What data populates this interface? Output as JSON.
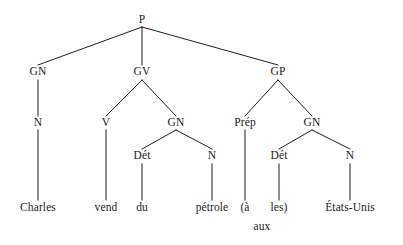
{
  "figure": {
    "kind": "syntax-tree",
    "language": "French",
    "sentence": "Charles vend du pétrole aux États-Unis",
    "line_color": "#1f1f1f",
    "text_color": "#1a1a1a",
    "background_color": "#ffffff"
  },
  "nodes": [
    {
      "id": "P",
      "label": "P",
      "x": 142,
      "y": 20,
      "type": "category"
    },
    {
      "id": "GN1",
      "label": "GN",
      "x": 38,
      "y": 72,
      "type": "category"
    },
    {
      "id": "GV",
      "label": "GV",
      "x": 142,
      "y": 72,
      "type": "category"
    },
    {
      "id": "GP",
      "label": "GP",
      "x": 278,
      "y": 72,
      "type": "category"
    },
    {
      "id": "N1",
      "label": "N",
      "x": 38,
      "y": 123,
      "type": "category"
    },
    {
      "id": "V",
      "label": "V",
      "x": 106,
      "y": 123,
      "type": "category"
    },
    {
      "id": "GN2",
      "label": "GN",
      "x": 176,
      "y": 123,
      "type": "category"
    },
    {
      "id": "Prep",
      "label": "Prép",
      "x": 245,
      "y": 123,
      "type": "category"
    },
    {
      "id": "GN3",
      "label": "GN",
      "x": 312,
      "y": 123,
      "type": "category"
    },
    {
      "id": "Det1",
      "label": "Dét",
      "x": 142,
      "y": 156,
      "type": "category"
    },
    {
      "id": "N2",
      "label": "N",
      "x": 212,
      "y": 156,
      "type": "category"
    },
    {
      "id": "Det2",
      "label": "Dét",
      "x": 279,
      "y": 156,
      "type": "category"
    },
    {
      "id": "N3",
      "label": "N",
      "x": 350,
      "y": 156,
      "type": "category"
    },
    {
      "id": "w_charles",
      "label": "Charles",
      "x": 38,
      "y": 208,
      "type": "leaf"
    },
    {
      "id": "w_vend",
      "label": "vend",
      "x": 106,
      "y": 208,
      "type": "leaf"
    },
    {
      "id": "w_du",
      "label": "du",
      "x": 142,
      "y": 208,
      "type": "leaf"
    },
    {
      "id": "w_petrole",
      "label": "pétrole",
      "x": 212,
      "y": 208,
      "type": "leaf"
    },
    {
      "id": "w_a",
      "label": "(à",
      "x": 245,
      "y": 208,
      "type": "leaf"
    },
    {
      "id": "w_les",
      "label": "les)",
      "x": 279,
      "y": 208,
      "type": "leaf"
    },
    {
      "id": "w_etats",
      "label": "États-Unis",
      "x": 350,
      "y": 208,
      "type": "leaf"
    },
    {
      "id": "w_aux",
      "label": "aux",
      "x": 262,
      "y": 227,
      "type": "gloss"
    }
  ],
  "edges": [
    {
      "from": "P",
      "to": "GN1",
      "x1": 142,
      "y1": 27,
      "x2": 38,
      "y2": 65
    },
    {
      "from": "P",
      "to": "GV",
      "x1": 142,
      "y1": 27,
      "x2": 142,
      "y2": 65
    },
    {
      "from": "P",
      "to": "GP",
      "x1": 142,
      "y1": 27,
      "x2": 278,
      "y2": 65
    },
    {
      "from": "GN1",
      "to": "N1",
      "x1": 38,
      "y1": 80,
      "x2": 38,
      "y2": 116
    },
    {
      "from": "GV",
      "to": "V",
      "x1": 142,
      "y1": 80,
      "x2": 106,
      "y2": 116
    },
    {
      "from": "GV",
      "to": "GN2",
      "x1": 142,
      "y1": 80,
      "x2": 176,
      "y2": 116
    },
    {
      "from": "GP",
      "to": "Prep",
      "x1": 278,
      "y1": 80,
      "x2": 245,
      "y2": 116
    },
    {
      "from": "GP",
      "to": "GN3",
      "x1": 278,
      "y1": 80,
      "x2": 312,
      "y2": 116
    },
    {
      "from": "N1",
      "to": "w_charles",
      "x1": 38,
      "y1": 130,
      "x2": 38,
      "y2": 200
    },
    {
      "from": "V",
      "to": "w_vend",
      "x1": 106,
      "y1": 130,
      "x2": 106,
      "y2": 200
    },
    {
      "from": "GN2",
      "to": "Det1",
      "x1": 176,
      "y1": 130,
      "x2": 142,
      "y2": 149
    },
    {
      "from": "GN2",
      "to": "N2",
      "x1": 176,
      "y1": 130,
      "x2": 212,
      "y2": 149
    },
    {
      "from": "Prep",
      "to": "w_a",
      "x1": 245,
      "y1": 130,
      "x2": 245,
      "y2": 200
    },
    {
      "from": "GN3",
      "to": "Det2",
      "x1": 312,
      "y1": 130,
      "x2": 279,
      "y2": 149
    },
    {
      "from": "GN3",
      "to": "N3",
      "x1": 312,
      "y1": 130,
      "x2": 350,
      "y2": 149
    },
    {
      "from": "Det1",
      "to": "w_du",
      "x1": 142,
      "y1": 164,
      "x2": 142,
      "y2": 200
    },
    {
      "from": "N2",
      "to": "w_petrole",
      "x1": 212,
      "y1": 164,
      "x2": 212,
      "y2": 200
    },
    {
      "from": "Det2",
      "to": "w_les",
      "x1": 279,
      "y1": 164,
      "x2": 279,
      "y2": 200
    },
    {
      "from": "N3",
      "to": "w_etats",
      "x1": 350,
      "y1": 164,
      "x2": 350,
      "y2": 200
    }
  ]
}
